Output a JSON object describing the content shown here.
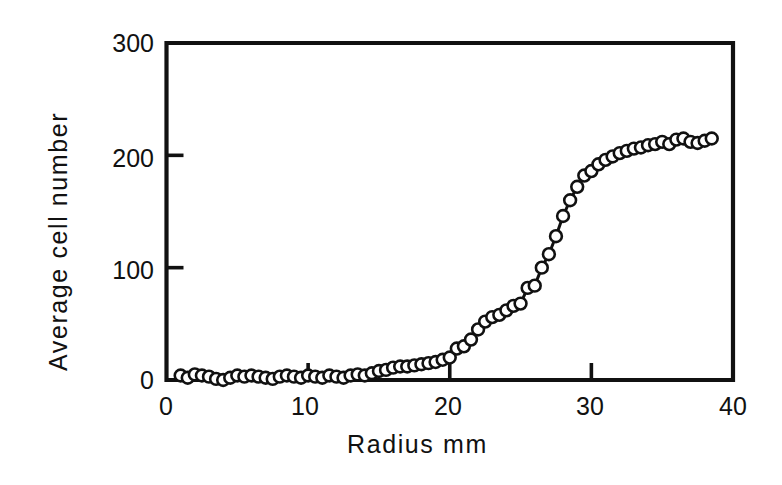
{
  "figure": {
    "background_color": "#ffffff",
    "ink_color": "#111111"
  },
  "chart_data": {
    "type": "line",
    "title": "",
    "subtitle": "",
    "xlabel": "Radius mm",
    "ylabel": "Average cell number",
    "xlim": [
      0,
      40
    ],
    "ylim": [
      0,
      300
    ],
    "xticks": [
      0,
      10,
      20,
      30,
      40
    ],
    "xticklabels": [
      "0",
      "10",
      "20",
      "30",
      "40"
    ],
    "yticks": [
      0,
      100,
      200,
      300
    ],
    "yticklabels": [
      "0",
      "100",
      "200",
      "300"
    ],
    "grid": false,
    "legend": null,
    "legend_position": "none",
    "marker": "open-circle",
    "marker_size": 7,
    "line_style": "solid",
    "tick_direction": "in",
    "spines": [
      "left",
      "bottom",
      "top",
      "right"
    ],
    "annotations": [],
    "series": [
      {
        "name": "Average cell number",
        "x": [
          1.0,
          1.5,
          2.0,
          2.5,
          3.0,
          3.5,
          4.0,
          4.5,
          5.0,
          5.5,
          6.0,
          6.5,
          7.0,
          7.5,
          8.0,
          8.5,
          9.0,
          9.5,
          10.0,
          10.5,
          11.0,
          11.5,
          12.0,
          12.5,
          13.0,
          13.5,
          14.0,
          14.5,
          15.0,
          15.5,
          16.0,
          16.5,
          17.0,
          17.5,
          18.0,
          18.5,
          19.0,
          19.5,
          20.0,
          20.5,
          21.0,
          21.5,
          22.0,
          22.5,
          23.0,
          23.5,
          24.0,
          24.5,
          25.0,
          25.5,
          26.0,
          26.5,
          27.0,
          27.5,
          28.0,
          28.5,
          29.0,
          29.5,
          30.0,
          30.5,
          31.0,
          31.5,
          32.0,
          32.5,
          33.0,
          33.5,
          34.0,
          34.5,
          35.0,
          35.5,
          36.0,
          36.5,
          37.0,
          37.5,
          38.0,
          38.5
        ],
        "y": [
          4,
          2,
          5,
          4,
          3,
          1,
          0,
          2,
          4,
          3,
          4,
          3,
          2,
          1,
          3,
          4,
          3,
          2,
          4,
          3,
          2,
          4,
          3,
          2,
          4,
          5,
          4,
          6,
          8,
          9,
          11,
          12,
          12,
          13,
          14,
          15,
          16,
          18,
          20,
          28,
          30,
          36,
          45,
          52,
          56,
          58,
          62,
          66,
          68,
          82,
          84,
          100,
          112,
          128,
          146,
          160,
          172,
          182,
          186,
          192,
          196,
          199,
          202,
          204,
          206,
          207,
          209,
          210,
          212,
          210,
          214,
          215,
          212,
          211,
          213,
          215
        ]
      }
    ]
  }
}
